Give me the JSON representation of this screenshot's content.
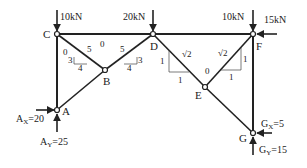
{
  "diagram": {
    "type": "truss",
    "nodes": [
      {
        "id": "C",
        "label": "C"
      },
      {
        "id": "D",
        "label": "D"
      },
      {
        "id": "F",
        "label": "F"
      },
      {
        "id": "B",
        "label": "B"
      },
      {
        "id": "E",
        "label": "E"
      },
      {
        "id": "A",
        "label": "A"
      },
      {
        "id": "G",
        "label": "G"
      }
    ],
    "members": [
      {
        "from": "C",
        "to": "D",
        "force_label": "0"
      },
      {
        "from": "D",
        "to": "F",
        "force_label": ""
      },
      {
        "from": "C",
        "to": "A",
        "force_label": ""
      },
      {
        "from": "C",
        "to": "B",
        "force_label": "0"
      },
      {
        "from": "D",
        "to": "B",
        "force_label": ""
      },
      {
        "from": "B",
        "to": "A",
        "force_label": ""
      },
      {
        "from": "D",
        "to": "E",
        "force_label": ""
      },
      {
        "from": "E",
        "to": "F",
        "force_label": "0"
      },
      {
        "from": "F",
        "to": "G",
        "force_label": ""
      },
      {
        "from": "E",
        "to": "G",
        "force_label": ""
      }
    ],
    "slope_triangles": {
      "CB": {
        "hyp": "5",
        "rise": "3",
        "run": "4"
      },
      "DB": {
        "hyp": "5",
        "rise": "3",
        "run": "4"
      },
      "DE": {
        "hyp": "√2",
        "rise": "1",
        "run": "1"
      },
      "EF": {
        "hyp": "√2",
        "rise": "1",
        "run": "1"
      }
    },
    "loads": {
      "C": "10kN",
      "D": "20kN",
      "F_vertical": "10kN",
      "F_horizontal": "15kN"
    },
    "reactions": {
      "Ax_label": "A",
      "Ax_sub": "X",
      "Ax_value": "=20",
      "Ay_label": "A",
      "Ay_sub": "Y",
      "Ay_value": "=25",
      "Gx_label": "G",
      "Gx_sub": "X",
      "Gx_value": "=5",
      "Gy_label": "G",
      "Gy_sub": "Y",
      "Gy_value": "=15"
    },
    "zero_labels": {
      "CD": "0",
      "CB": "0",
      "EF": "0"
    }
  }
}
